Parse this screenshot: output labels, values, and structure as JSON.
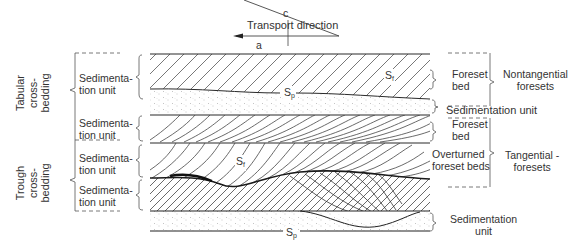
{
  "diagram": {
    "transport": {
      "label": "Transport direction",
      "axis_c": "c",
      "axis_a": "a"
    },
    "left_groups": [
      {
        "label_line1": "Tabular",
        "label_line2": "cross-",
        "label_line3": "bedding"
      },
      {
        "label_line1": "Trough",
        "label_line2": "cross-",
        "label_line3": "bedding"
      }
    ],
    "left_units": [
      {
        "line1": "Sedimenta-",
        "line2": "tion unit"
      },
      {
        "line1": "Sedimenta-",
        "line2": "tion unit"
      },
      {
        "line1": "Sedimenta-",
        "line2": "tion unit"
      },
      {
        "line1": "Sedimenta-",
        "line2": "tion unit"
      }
    ],
    "inner_labels": {
      "sf_top": "S",
      "sf_top_sub": "f",
      "sp_mid": "S",
      "sp_mid_sub": "p",
      "sf_bottom": "S",
      "sf_bottom_sub": "f",
      "sp_bottom": "S",
      "sp_bottom_sub": "p"
    },
    "right_labels": {
      "foreset_bed_1": {
        "line1": "Foreset",
        "line2": "bed"
      },
      "nontangential": {
        "line1": "Nontangential",
        "line2": "foresets"
      },
      "sedimentation_unit_1": "Sedimentation unit",
      "foreset_bed_2": {
        "line1": "Foreset",
        "line2": "bed"
      },
      "overturned": {
        "line1": "Overturned",
        "line2": "foreset beds"
      },
      "tangential": {
        "line1": "Tangential -",
        "line2": "foresets"
      },
      "sedimentation_unit_2": {
        "line1": "Sedimentation",
        "line2": "unit"
      }
    },
    "colors": {
      "line": "#2a2a2a",
      "hatch": "#555555",
      "stipple": "#8a8a8a"
    }
  }
}
